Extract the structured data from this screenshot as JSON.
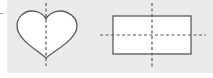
{
  "diagram": {
    "background_color": "#ebebeb",
    "stroke_color": "#555555",
    "fill_color": "#ffffff",
    "shapes": [
      {
        "name": "heart",
        "symmetry_lines": [
          "vertical"
        ],
        "symmetry_line_count": 1
      },
      {
        "name": "rectangle",
        "symmetry_lines": [
          "vertical",
          "horizontal"
        ],
        "symmetry_line_count": 2
      }
    ]
  }
}
